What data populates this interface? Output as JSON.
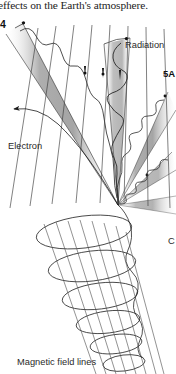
{
  "page": {
    "width": 176,
    "height": 374,
    "background": "#ffffff"
  },
  "caption": {
    "text": "effects on the Earth's atmosphere."
  },
  "labels": {
    "panel_number": "4",
    "radiation": "Radiation",
    "panel_next": "5A",
    "electron": "Electron",
    "partial_right": "C",
    "magnetic_field_lines": "Magnetic field lines"
  },
  "diagram": {
    "colors": {
      "line": "#1a1a1a",
      "cone_fill": "#9a9a9a",
      "cone_fill_light": "#c8c8c8",
      "wave": "#333333",
      "field_line": "#4a4a4a",
      "text": "#2a2a2a"
    },
    "convergence_point": {
      "x": 118,
      "y": 205
    },
    "radiation_cones": [
      {
        "name": "cone-upper-left",
        "angle_deg": 222,
        "length": 165,
        "half_width_deg": 5.5
      },
      {
        "name": "cone-upper-right",
        "angle_deg": 287,
        "length": 160,
        "half_width_deg": 5.0
      },
      {
        "name": "cone-right-upper",
        "angle_deg": 318,
        "length": 120,
        "half_width_deg": 4.5
      },
      {
        "name": "cone-right-lower",
        "angle_deg": 341,
        "length": 95,
        "half_width_deg": 4.0
      },
      {
        "name": "cone-right-far",
        "angle_deg": 356,
        "length": 80,
        "half_width_deg": 3.5
      }
    ],
    "field_line_count": 8,
    "helix_loop_count": 6,
    "electron_arrow": {
      "from_x": 80,
      "from_y": 118,
      "to_x": 12,
      "to_y": 110
    }
  }
}
